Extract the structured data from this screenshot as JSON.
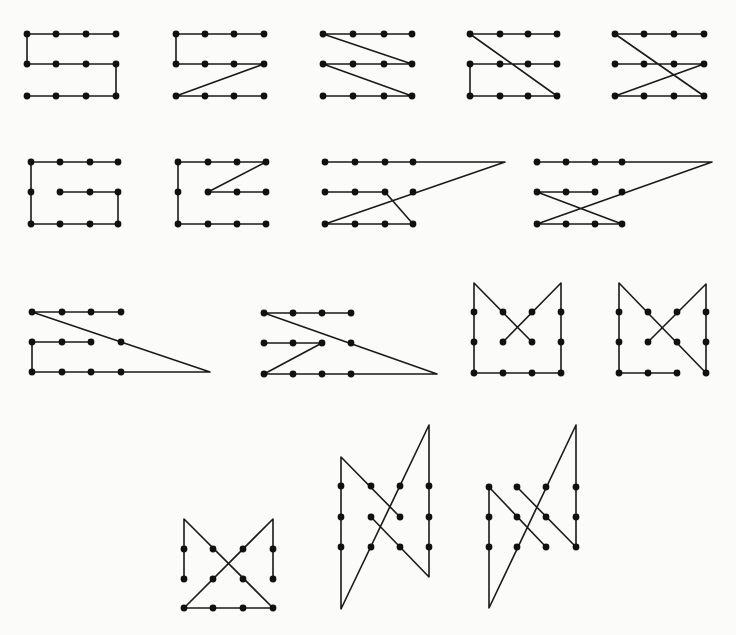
{
  "title": "Nine-dot / twelve-dot path puzzle solutions",
  "style": {
    "stroke": "#1a1a1a",
    "dot": "#111111",
    "background": "#fbfbfa"
  },
  "figures": [
    {
      "id": "fig-1-1",
      "label": "S path",
      "dots": [
        [
          27,
          34
        ],
        [
          56,
          34
        ],
        [
          86,
          34
        ],
        [
          116,
          34
        ],
        [
          27,
          64
        ],
        [
          56,
          64
        ],
        [
          86,
          64
        ],
        [
          116,
          64
        ],
        [
          27,
          96
        ],
        [
          56,
          96
        ],
        [
          86,
          96
        ],
        [
          116,
          96
        ]
      ],
      "paths": [
        [
          [
            116,
            34
          ],
          [
            27,
            34
          ],
          [
            27,
            64
          ],
          [
            116,
            64
          ],
          [
            116,
            96
          ],
          [
            27,
            96
          ]
        ]
      ]
    },
    {
      "id": "fig-1-2",
      "label": "Z-bottom path",
      "dots": [
        [
          176,
          34
        ],
        [
          205,
          34
        ],
        [
          234,
          34
        ],
        [
          264,
          34
        ],
        [
          176,
          64
        ],
        [
          205,
          64
        ],
        [
          234,
          64
        ],
        [
          264,
          64
        ],
        [
          176,
          96
        ],
        [
          205,
          96
        ],
        [
          234,
          96
        ],
        [
          264,
          96
        ]
      ],
      "paths": [
        [
          [
            264,
            34
          ],
          [
            176,
            34
          ],
          [
            176,
            64
          ],
          [
            264,
            64
          ],
          [
            176,
            96
          ],
          [
            264,
            96
          ]
        ]
      ]
    },
    {
      "id": "fig-1-3",
      "label": "Double zigzag",
      "dots": [
        [
          323,
          34
        ],
        [
          353,
          34
        ],
        [
          384,
          34
        ],
        [
          412,
          34
        ],
        [
          323,
          64
        ],
        [
          353,
          64
        ],
        [
          384,
          64
        ],
        [
          412,
          64
        ],
        [
          323,
          96
        ],
        [
          353,
          96
        ],
        [
          384,
          96
        ],
        [
          412,
          96
        ]
      ],
      "paths": [
        [
          [
            412,
            34
          ],
          [
            323,
            34
          ],
          [
            412,
            64
          ],
          [
            323,
            64
          ],
          [
            412,
            96
          ],
          [
            323,
            96
          ]
        ]
      ]
    },
    {
      "id": "fig-1-4",
      "label": "Diagonal with C",
      "dots": [
        [
          470,
          34
        ],
        [
          500,
          34
        ],
        [
          528,
          34
        ],
        [
          557,
          34
        ],
        [
          470,
          64
        ],
        [
          500,
          64
        ],
        [
          528,
          64
        ],
        [
          557,
          64
        ],
        [
          470,
          96
        ],
        [
          500,
          96
        ],
        [
          528,
          96
        ],
        [
          557,
          96
        ]
      ],
      "paths": [
        [
          [
            557,
            34
          ],
          [
            470,
            34
          ],
          [
            557,
            96
          ],
          [
            470,
            96
          ],
          [
            470,
            64
          ],
          [
            557,
            64
          ]
        ]
      ]
    },
    {
      "id": "fig-1-5",
      "label": "Crossed diagonals",
      "dots": [
        [
          615,
          34
        ],
        [
          644,
          34
        ],
        [
          674,
          34
        ],
        [
          704,
          34
        ],
        [
          615,
          64
        ],
        [
          644,
          64
        ],
        [
          674,
          64
        ],
        [
          704,
          64
        ],
        [
          615,
          96
        ],
        [
          644,
          96
        ],
        [
          674,
          96
        ],
        [
          704,
          96
        ]
      ],
      "paths": [
        [
          [
            704,
            34
          ],
          [
            615,
            34
          ],
          [
            704,
            96
          ],
          [
            615,
            96
          ],
          [
            704,
            64
          ],
          [
            615,
            64
          ]
        ]
      ]
    },
    {
      "id": "fig-2-1",
      "label": "G path",
      "dots": [
        [
          31,
          162
        ],
        [
          60,
          162
        ],
        [
          90,
          162
        ],
        [
          118,
          162
        ],
        [
          31,
          192
        ],
        [
          60,
          192
        ],
        [
          90,
          192
        ],
        [
          118,
          192
        ],
        [
          31,
          224
        ],
        [
          60,
          224
        ],
        [
          90,
          224
        ],
        [
          118,
          224
        ]
      ],
      "paths": [
        [
          [
            118,
            162
          ],
          [
            31,
            162
          ],
          [
            31,
            224
          ],
          [
            118,
            224
          ],
          [
            118,
            192
          ],
          [
            60,
            192
          ]
        ]
      ]
    },
    {
      "id": "fig-2-2",
      "label": "G with diagonal",
      "dots": [
        [
          178,
          162
        ],
        [
          208,
          162
        ],
        [
          237,
          162
        ],
        [
          266,
          162
        ],
        [
          178,
          192
        ],
        [
          208,
          192
        ],
        [
          237,
          192
        ],
        [
          266,
          192
        ],
        [
          178,
          224
        ],
        [
          208,
          224
        ],
        [
          237,
          224
        ],
        [
          266,
          224
        ]
      ],
      "paths": [
        [
          [
            266,
            192
          ],
          [
            208,
            192
          ],
          [
            266,
            162
          ],
          [
            178,
            162
          ],
          [
            178,
            224
          ],
          [
            266,
            224
          ]
        ]
      ]
    },
    {
      "id": "fig-2-3",
      "label": "Extended apex path A",
      "dots": [
        [
          325,
          162
        ],
        [
          355,
          162
        ],
        [
          385,
          162
        ],
        [
          413,
          162
        ],
        [
          325,
          192
        ],
        [
          355,
          192
        ],
        [
          385,
          192
        ],
        [
          413,
          192
        ],
        [
          325,
          224
        ],
        [
          355,
          224
        ],
        [
          385,
          224
        ],
        [
          413,
          224
        ]
      ],
      "paths": [
        [
          [
            325,
            192
          ],
          [
            385,
            192
          ],
          [
            413,
            224
          ],
          [
            325,
            224
          ],
          [
            505,
            162
          ],
          [
            325,
            162
          ]
        ]
      ]
    },
    {
      "id": "fig-2-4",
      "label": "Extended apex path B",
      "dots": [
        [
          537,
          162
        ],
        [
          566,
          162
        ],
        [
          595,
          162
        ],
        [
          622,
          162
        ],
        [
          537,
          192
        ],
        [
          566,
          192
        ],
        [
          595,
          192
        ],
        [
          622,
          192
        ],
        [
          537,
          224
        ],
        [
          566,
          224
        ],
        [
          595,
          224
        ],
        [
          622,
          224
        ]
      ],
      "paths": [
        [
          [
            595,
            192
          ],
          [
            537,
            192
          ],
          [
            622,
            224
          ],
          [
            537,
            224
          ],
          [
            712,
            162
          ],
          [
            537,
            162
          ]
        ]
      ]
    },
    {
      "id": "fig-3-1",
      "label": "Long triangle A",
      "dots": [
        [
          32,
          312
        ],
        [
          62,
          312
        ],
        [
          91,
          312
        ],
        [
          121,
          312
        ],
        [
          32,
          342
        ],
        [
          62,
          342
        ],
        [
          91,
          342
        ],
        [
          121,
          342
        ],
        [
          32,
          372
        ],
        [
          62,
          372
        ],
        [
          91,
          372
        ],
        [
          121,
          372
        ]
      ],
      "paths": [
        [
          [
            121,
            312
          ],
          [
            32,
            312
          ],
          [
            210,
            372
          ],
          [
            32,
            372
          ],
          [
            32,
            342
          ],
          [
            91,
            342
          ]
        ]
      ]
    },
    {
      "id": "fig-3-2",
      "label": "Long triangle B",
      "dots": [
        [
          264,
          313
        ],
        [
          293,
          313
        ],
        [
          322,
          313
        ],
        [
          351,
          313
        ],
        [
          264,
          343
        ],
        [
          293,
          343
        ],
        [
          322,
          343
        ],
        [
          351,
          343
        ],
        [
          264,
          374
        ],
        [
          293,
          374
        ],
        [
          322,
          374
        ],
        [
          351,
          374
        ]
      ],
      "paths": [
        [
          [
            351,
            313
          ],
          [
            264,
            313
          ],
          [
            437,
            374
          ],
          [
            264,
            374
          ],
          [
            322,
            343
          ],
          [
            264,
            343
          ]
        ]
      ]
    },
    {
      "id": "fig-3-3",
      "label": "M shape",
      "dots": [
        [
          474,
          312
        ],
        [
          503,
          312
        ],
        [
          532,
          312
        ],
        [
          561,
          312
        ],
        [
          474,
          342
        ],
        [
          503,
          342
        ],
        [
          532,
          342
        ],
        [
          561,
          342
        ],
        [
          474,
          373
        ],
        [
          503,
          373
        ],
        [
          532,
          373
        ],
        [
          561,
          373
        ]
      ],
      "paths": [
        [
          [
            532,
            342
          ],
          [
            474,
            283
          ],
          [
            474,
            373
          ],
          [
            561,
            373
          ],
          [
            561,
            283
          ],
          [
            503,
            342
          ]
        ]
      ]
    },
    {
      "id": "fig-3-4",
      "label": "Reverse-N shape",
      "dots": [
        [
          619,
          312
        ],
        [
          648,
          312
        ],
        [
          677,
          312
        ],
        [
          706,
          312
        ],
        [
          619,
          342
        ],
        [
          648,
          342
        ],
        [
          677,
          342
        ],
        [
          706,
          342
        ],
        [
          619,
          373
        ],
        [
          648,
          373
        ],
        [
          677,
          373
        ],
        [
          706,
          373
        ]
      ],
      "paths": [
        [
          [
            677,
            373
          ],
          [
            619,
            373
          ],
          [
            619,
            283
          ],
          [
            706,
            373
          ],
          [
            706,
            284
          ],
          [
            648,
            342
          ]
        ]
      ]
    },
    {
      "id": "fig-4-1",
      "label": "Bow-tie",
      "dots": [
        [
          184,
          549
        ],
        [
          213,
          549
        ],
        [
          243,
          549
        ],
        [
          273,
          549
        ],
        [
          184,
          579
        ],
        [
          213,
          579
        ],
        [
          243,
          579
        ],
        [
          273,
          579
        ],
        [
          184,
          608
        ],
        [
          213,
          608
        ],
        [
          243,
          608
        ],
        [
          273,
          608
        ]
      ],
      "paths": [
        [
          [
            184,
            579
          ],
          [
            184,
            519
          ],
          [
            273,
            608
          ],
          [
            184,
            608
          ],
          [
            273,
            519
          ],
          [
            273,
            579
          ]
        ]
      ]
    },
    {
      "id": "fig-4-2",
      "label": "Tall N with crossings",
      "dots": [
        [
          341,
          486
        ],
        [
          371,
          486
        ],
        [
          400,
          486
        ],
        [
          429,
          486
        ],
        [
          341,
          517
        ],
        [
          371,
          517
        ],
        [
          400,
          517
        ],
        [
          429,
          517
        ],
        [
          341,
          547
        ],
        [
          371,
          547
        ],
        [
          400,
          547
        ],
        [
          429,
          547
        ]
      ],
      "paths": [
        [
          [
            400,
            517
          ],
          [
            341,
            457
          ],
          [
            341,
            609
          ],
          [
            429,
            425
          ],
          [
            429,
            577
          ],
          [
            371,
            517
          ]
        ]
      ]
    },
    {
      "id": "fig-4-3",
      "label": "Tall N variant",
      "dots": [
        [
          489,
          487
        ],
        [
          517,
          487
        ],
        [
          546,
          487
        ],
        [
          576,
          487
        ],
        [
          489,
          517
        ],
        [
          517,
          517
        ],
        [
          546,
          517
        ],
        [
          576,
          517
        ],
        [
          489,
          547
        ],
        [
          517,
          547
        ],
        [
          546,
          547
        ],
        [
          576,
          547
        ]
      ],
      "paths": [
        [
          [
            546,
            547
          ],
          [
            489,
            487
          ],
          [
            489,
            608
          ],
          [
            576,
            425
          ],
          [
            576,
            547
          ],
          [
            517,
            487
          ]
        ]
      ]
    }
  ]
}
